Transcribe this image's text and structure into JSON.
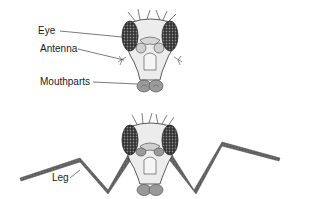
{
  "diagram": {
    "top_figure": {
      "labels": [
        {
          "id": "eye",
          "text": "Eye"
        },
        {
          "id": "antenna",
          "text": "Antenna"
        },
        {
          "id": "mouthparts",
          "text": "Mouthparts"
        }
      ]
    },
    "bottom_figure": {
      "labels": [
        {
          "id": "leg",
          "text": "Leg"
        }
      ]
    },
    "colors": {
      "eye_fill": "#3a3a3a",
      "head_fill": "#e8e8e8",
      "leg_fill": "#6a6a6a",
      "outline": "#333333"
    }
  }
}
